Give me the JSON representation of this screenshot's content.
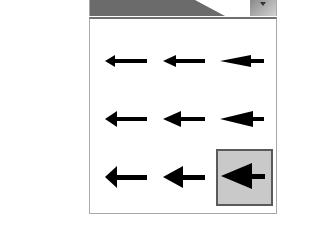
{
  "arrow_style_picker": {
    "current_value": "arrowhead-style-9",
    "dropdown_icon": "chevron-down-icon",
    "options": [
      {
        "name": "arrowhead-style-1",
        "row": 0,
        "col": 0,
        "selected": false
      },
      {
        "name": "arrowhead-style-2",
        "row": 0,
        "col": 1,
        "selected": false
      },
      {
        "name": "arrowhead-style-3",
        "row": 0,
        "col": 2,
        "selected": false
      },
      {
        "name": "arrowhead-style-4",
        "row": 1,
        "col": 0,
        "selected": false
      },
      {
        "name": "arrowhead-style-5",
        "row": 1,
        "col": 1,
        "selected": false
      },
      {
        "name": "arrowhead-style-6",
        "row": 1,
        "col": 2,
        "selected": false
      },
      {
        "name": "arrowhead-style-7",
        "row": 2,
        "col": 0,
        "selected": false
      },
      {
        "name": "arrowhead-style-8",
        "row": 2,
        "col": 1,
        "selected": false
      },
      {
        "name": "arrowhead-style-9",
        "row": 2,
        "col": 2,
        "selected": true
      }
    ]
  },
  "colors": {
    "header_bg": "#6b6b6b",
    "selected_bg": "#c9c9c9",
    "selected_border": "#5a5a5a",
    "arrow": "#000000"
  }
}
